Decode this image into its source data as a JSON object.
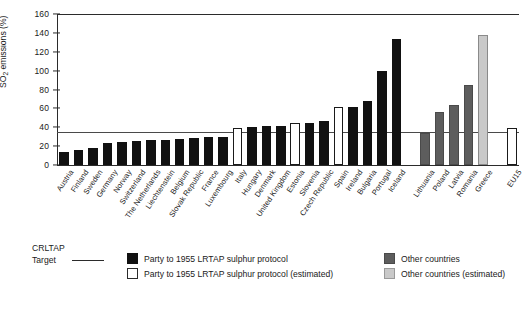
{
  "chart_data": {
    "type": "bar",
    "title": "",
    "xlabel": "",
    "ylabel": "SO2 emissions (%)",
    "ylim": [
      0,
      160
    ],
    "yticks": [
      0,
      20,
      40,
      60,
      80,
      100,
      120,
      140,
      160
    ],
    "grid": false,
    "legend_position": "bottom",
    "reference_lines": [
      {
        "name": "CRLTAP Target",
        "value": 35
      }
    ],
    "categories": [
      "Austria",
      "Finland",
      "Sweden",
      "Germany",
      "Norway",
      "Switzerland",
      "The Netherlands",
      "Liechtenstein",
      "Belgium",
      "Slovak Republic",
      "France",
      "Luxembourg",
      "Italy",
      "Hungary",
      "Denmark",
      "United Kingdom",
      "Estonia",
      "Slovenia",
      "Czech Republic",
      "Spain",
      "Ireland",
      "Bulgaria",
      "Portugal",
      "Iceland",
      "",
      "Lithuania",
      "Poland",
      "Latvia",
      "Romania",
      "Greece",
      "",
      "EU15"
    ],
    "values": [
      14,
      15.5,
      18,
      23.5,
      24,
      25,
      26.5,
      27,
      28,
      28.5,
      29.5,
      30,
      39,
      40,
      41,
      41,
      44,
      45,
      46.5,
      61,
      61,
      68,
      100,
      133,
      null,
      34,
      56,
      64,
      85,
      138,
      null,
      39
    ],
    "bar_styles": [
      "black",
      "black",
      "black",
      "black",
      "black",
      "black",
      "black",
      "black",
      "black",
      "black",
      "black",
      "black",
      "black-open",
      "black",
      "black",
      "black",
      "black-open",
      "black",
      "black",
      "black-open",
      "black",
      "black",
      "black",
      "black",
      "gap",
      "grey",
      "grey",
      "grey",
      "grey",
      "grey-open",
      "gap",
      "black-open"
    ],
    "series": [
      {
        "name": "Party to 1955 LRTAP sulphur protocol",
        "style": "black",
        "points": [
          {
            "label": "Austria",
            "value": 14
          },
          {
            "label": "Finland",
            "value": 15.5
          },
          {
            "label": "Sweden",
            "value": 18
          },
          {
            "label": "Germany",
            "value": 23.5
          },
          {
            "label": "Norway",
            "value": 24
          },
          {
            "label": "Switzerland",
            "value": 25
          },
          {
            "label": "The Netherlands",
            "value": 26.5
          },
          {
            "label": "Liechtenstein",
            "value": 27
          },
          {
            "label": "Belgium",
            "value": 28
          },
          {
            "label": "Slovak Republic",
            "value": 28.5
          },
          {
            "label": "France",
            "value": 29.5
          },
          {
            "label": "Luxembourg",
            "value": 30
          },
          {
            "label": "Hungary",
            "value": 40
          },
          {
            "label": "Denmark",
            "value": 41
          },
          {
            "label": "United Kingdom",
            "value": 41
          },
          {
            "label": "Slovenia",
            "value": 45
          },
          {
            "label": "Czech Republic",
            "value": 46.5
          },
          {
            "label": "Ireland",
            "value": 61
          },
          {
            "label": "Bulgaria",
            "value": 68
          },
          {
            "label": "Portugal",
            "value": 100
          },
          {
            "label": "Iceland",
            "value": 133
          }
        ]
      },
      {
        "name": "Party to 1955 LRTAP sulphur protocol (estimated)",
        "style": "black-open",
        "points": [
          {
            "label": "Italy",
            "value": 39
          },
          {
            "label": "Estonia",
            "value": 44
          },
          {
            "label": "Spain",
            "value": 61
          },
          {
            "label": "EU15",
            "value": 39
          }
        ]
      },
      {
        "name": "Other countries",
        "style": "grey",
        "points": [
          {
            "label": "Lithuania",
            "value": 34
          },
          {
            "label": "Poland",
            "value": 56
          },
          {
            "label": "Latvia",
            "value": 64
          },
          {
            "label": "Romania",
            "value": 85
          }
        ]
      },
      {
        "name": "Other countries (estimated)",
        "style": "grey-open",
        "points": [
          {
            "label": "Greece",
            "value": 138
          }
        ]
      }
    ]
  },
  "axis": {
    "y_title_main": "SO",
    "y_title_sub": "2",
    "y_title_rest": " emissions (%)"
  },
  "legend": {
    "target_line_1": "CRLTAP",
    "target_line_2": "Target",
    "items": [
      {
        "style": "black",
        "label": "Party to 1955 LRTAP sulphur protocol"
      },
      {
        "style": "black-open",
        "label": "Party to 1955 LRTAP sulphur protocol (estimated)"
      },
      {
        "style": "grey",
        "label": "Other countries"
      },
      {
        "style": "grey-open",
        "label": "Other countries (estimated)"
      }
    ]
  },
  "colors": {
    "black": "#111111",
    "grey": "#5d5d5d",
    "light_grey": "#c9c9c9",
    "axis": "#2b2b2b",
    "target": "#4a4a4a",
    "background": "#ffffff"
  }
}
